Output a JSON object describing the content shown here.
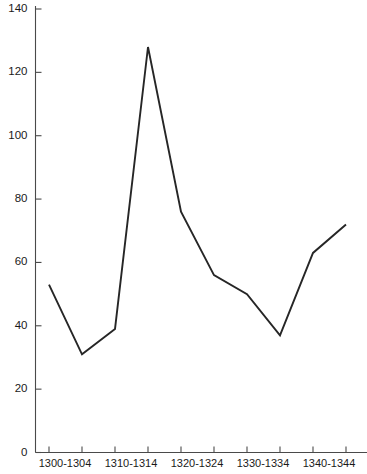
{
  "chart": {
    "title": "",
    "background_color": "#ffffff",
    "line_color": "#262626",
    "axis_color": "#4a4a4a"
  },
  "chart_data": {
    "type": "line",
    "title": "",
    "xlabel": "",
    "ylabel": "",
    "ylim": [
      0,
      140
    ],
    "grid": false,
    "legend": "none",
    "categories": [
      "1300-1304",
      "1305-1309",
      "1310-1314",
      "1315-1319",
      "1320-1324",
      "1325-1329",
      "1330-1334",
      "1335-1339",
      "1340-1344",
      "1345-1349"
    ],
    "values": [
      53,
      31,
      39,
      128,
      76,
      56,
      50,
      37,
      63,
      72
    ],
    "y_ticks": [
      0,
      20,
      40,
      60,
      80,
      100,
      120,
      140
    ],
    "y_tick_labels": [
      "0",
      "20",
      "40",
      "60",
      "80",
      "100",
      "120",
      "140"
    ],
    "x_tick_labels_visible": [
      "1300-1304",
      "1310-1314",
      "1320-1324",
      "1330-1334",
      "1340-1344"
    ],
    "x_tick_label_indices": [
      0,
      2,
      4,
      6,
      8
    ]
  },
  "yticks": [
    {
      "label": "140",
      "value": 140
    },
    {
      "label": "120",
      "value": 120
    },
    {
      "label": "100",
      "value": 100
    },
    {
      "label": "80",
      "value": 80
    },
    {
      "label": "60",
      "value": 60
    },
    {
      "label": "40",
      "value": 40
    },
    {
      "label": "20",
      "value": 20
    },
    {
      "label": "0",
      "value": 0
    }
  ],
  "xticks": [
    {
      "label": "1300-1304",
      "index": 0,
      "visible": true
    },
    {
      "label": "",
      "index": 1,
      "visible": false
    },
    {
      "label": "1310-1314",
      "index": 2,
      "visible": true
    },
    {
      "label": "",
      "index": 3,
      "visible": false
    },
    {
      "label": "1320-1324",
      "index": 4,
      "visible": true
    },
    {
      "label": "",
      "index": 5,
      "visible": false
    },
    {
      "label": "1330-1334",
      "index": 6,
      "visible": true
    },
    {
      "label": "",
      "index": 7,
      "visible": false
    },
    {
      "label": "1340-1344",
      "index": 8,
      "visible": true
    },
    {
      "label": "",
      "index": 9,
      "visible": false
    }
  ]
}
